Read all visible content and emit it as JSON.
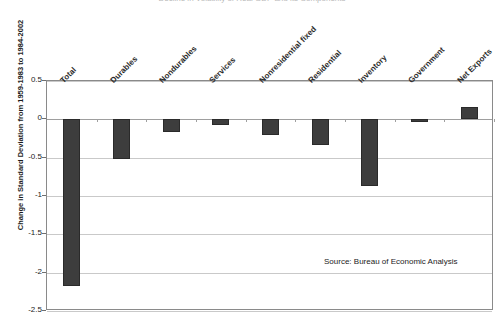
{
  "chart_data": {
    "type": "bar",
    "title": "Decline in Volatility of Real GDP and its Components",
    "xlabel": "",
    "ylabel": "Change in Standard Deviation from 1959-1983 to 1984-2002",
    "ylim": [
      -2.5,
      0.5
    ],
    "yticks": [
      0.5,
      0,
      -0.5,
      -1,
      -1.5,
      -2,
      -2.5
    ],
    "ytick_labels": [
      "0.5",
      "0",
      "-0.5",
      "-1",
      "-1.5",
      "-2",
      "-2.5"
    ],
    "grid": true,
    "legend": "none",
    "bar_color": "#3d3d3d",
    "categories": [
      "Total",
      "Durables",
      "Nondurables",
      "Services",
      "Nonresidential fixed",
      "Residential",
      "Inventory",
      "Government",
      "Net Exports"
    ],
    "values": [
      -2.17,
      -0.52,
      -0.17,
      -0.07,
      -0.21,
      -0.34,
      -0.87,
      -0.04,
      0.16
    ],
    "annotations": [
      {
        "text": "Source: Bureau of Economic Analysis"
      }
    ]
  },
  "source_note": "Source: Bureau of Economic Analysis"
}
